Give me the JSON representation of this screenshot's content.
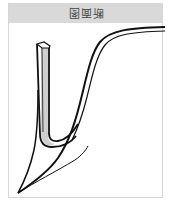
{
  "figure": {
    "title": "断面图",
    "title_rotation_deg": 180,
    "header_bg": "#d9d9d9",
    "frame_border": "#d6d6d6",
    "stroke_color": "#111111",
    "fill_color": "#cfcfcf"
  }
}
